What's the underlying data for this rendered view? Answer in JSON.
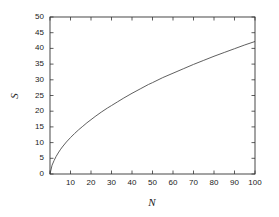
{
  "chart_data": {
    "type": "line",
    "title": "",
    "subtitle": "",
    "xlabel": "N",
    "ylabel": "S",
    "xlim": [
      0,
      100
    ],
    "ylim": [
      0,
      50
    ],
    "grid": false,
    "legend": null,
    "xticks": [
      0,
      10,
      20,
      30,
      40,
      50,
      60,
      70,
      80,
      90,
      100
    ],
    "xtick_labels": [
      "",
      "10",
      "20",
      "30",
      "40",
      "50",
      "60",
      "70",
      "80",
      "90",
      "100"
    ],
    "yticks": [
      0,
      5,
      10,
      15,
      20,
      25,
      30,
      35,
      40,
      45,
      50
    ],
    "ytick_labels": [
      "0",
      "5",
      "10",
      "15",
      "20",
      "25",
      "30",
      "35",
      "40",
      "45",
      "50"
    ],
    "line_color": "#4d4d4d",
    "axis_color": "#333333",
    "background_color": "#ffffff",
    "series": [
      {
        "name": "S vs N",
        "x": [
          0,
          1,
          2,
          3,
          4,
          5,
          6,
          8,
          10,
          12,
          14,
          16,
          18,
          20,
          22,
          25,
          28,
          30,
          33,
          36,
          40,
          44,
          48,
          50,
          55,
          60,
          65,
          70,
          75,
          80,
          85,
          90,
          95,
          100
        ],
        "y": [
          0,
          2.8,
          4.3,
          5.6,
          6.7,
          7.7,
          8.6,
          10.2,
          11.6,
          12.9,
          14.1,
          15.2,
          16.3,
          17.3,
          18.3,
          19.7,
          21.0,
          21.8,
          23.0,
          24.2,
          25.7,
          27.1,
          28.5,
          29.1,
          30.7,
          32.1,
          33.5,
          34.9,
          36.2,
          37.5,
          38.7,
          39.9,
          41.1,
          42.2
        ]
      }
    ],
    "curve_note": "S = 50 * (N/100)^0.63, concave increasing from origin to (100, 50)"
  },
  "axis_titles": {
    "y": "S",
    "x": "N"
  }
}
